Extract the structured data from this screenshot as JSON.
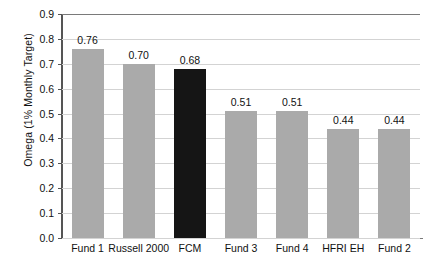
{
  "chart_data": {
    "type": "bar",
    "title": "",
    "xlabel": "",
    "ylabel": "Omega (1% Monthly Target)",
    "ylim": [
      0.0,
      0.9
    ],
    "ytick_labels": [
      "0.0",
      "0.1",
      "0.2",
      "0.3",
      "0.4",
      "0.5",
      "0.6",
      "0.7",
      "0.8",
      "0.9"
    ],
    "ytick_values": [
      0.0,
      0.1,
      0.2,
      0.3,
      0.4,
      0.5,
      0.6,
      0.7,
      0.8,
      0.9
    ],
    "grid": true,
    "legend": "none",
    "categories": [
      "Fund 1",
      "Russell 2000",
      "FCM",
      "Fund 3",
      "Fund 4",
      "HFRI EH",
      "Fund 2"
    ],
    "values": [
      0.76,
      0.7,
      0.68,
      0.51,
      0.51,
      0.44,
      0.44
    ],
    "data_labels": [
      "0.76",
      "0.70",
      "0.68",
      "0.51",
      "0.51",
      "0.44",
      "0.44"
    ],
    "bar_colors": [
      "#aaaaaa",
      "#aaaaaa",
      "#151515",
      "#aaaaaa",
      "#aaaaaa",
      "#aaaaaa",
      "#aaaaaa"
    ],
    "highlight_index": 2,
    "colors": {
      "bar_default": "#aaaaaa",
      "bar_highlight": "#151515",
      "gridline": "#d3d3d3",
      "axis": "#7a7a7a",
      "text": "#111111",
      "background": "#ffffff"
    }
  }
}
